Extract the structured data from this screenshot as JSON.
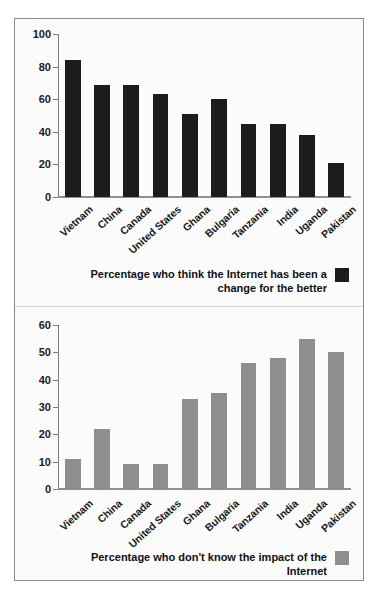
{
  "chart_data": [
    {
      "type": "bar",
      "id": "internet-change-for-better",
      "title": "",
      "xlabel": "",
      "ylabel": "",
      "ylim": [
        0,
        100
      ],
      "yticks": [
        0,
        20,
        40,
        60,
        80,
        100
      ],
      "grid": false,
      "legend_position": "bottom-right",
      "legend": "Percentage who think the Internet has been a change for the better",
      "legend_lines": [
        "Percentage who think the Internet has been a",
        "change for the better"
      ],
      "bar_color": "#1c1c1c",
      "categories": [
        "Vietnam",
        "China",
        "Canada",
        "United States",
        "Ghana",
        "Bulgaria",
        "Tanzania",
        "India",
        "Uganda",
        "Pakistan"
      ],
      "values": [
        84,
        69,
        69,
        63,
        51,
        60,
        45,
        45,
        38,
        21
      ]
    },
    {
      "type": "bar",
      "id": "internet-dont-know-impact",
      "title": "",
      "xlabel": "",
      "ylabel": "",
      "ylim": [
        0,
        60
      ],
      "yticks": [
        0,
        10,
        20,
        30,
        40,
        50,
        60
      ],
      "grid": false,
      "legend_position": "bottom-right",
      "legend": "Percentage who don't know the impact of the Internet",
      "legend_lines": [
        "Percentage who don't know the impact of the Internet"
      ],
      "bar_color": "#8e8e8e",
      "categories": [
        "Vietnam",
        "China",
        "Canada",
        "United States",
        "Ghana",
        "Bulgaria",
        "Tanzania",
        "India",
        "Uganda",
        "Pakistan"
      ],
      "values": [
        11,
        22,
        9,
        9,
        33,
        35,
        46,
        48,
        55,
        50
      ]
    }
  ]
}
